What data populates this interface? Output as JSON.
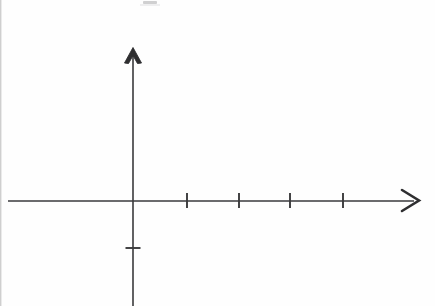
{
  "figure": {
    "background_color": "#fefefe",
    "stroke_color": "#3a3a3c",
    "width": 435,
    "height": 306
  },
  "chart_data": {
    "type": "scatter",
    "title": "",
    "subtitle": "",
    "xlabel": "",
    "ylabel": "",
    "grid": false,
    "legend": null,
    "annotations": [],
    "series": [
      {
        "name": "",
        "x": [],
        "y": []
      }
    ],
    "origin": {
      "x_px": 133,
      "y_px": 201
    },
    "x_axis": {
      "label": "",
      "start_px": 8,
      "end_px": 419,
      "axis_y_px": 201,
      "arrow": "right",
      "arrow_tip_px": {
        "x": 419,
        "y": 200
      },
      "tick_count": 4,
      "tick_positions_px": [
        187,
        239,
        290,
        343
      ],
      "tick_spacing_px": 52,
      "tick_length_px": 15,
      "tick_labels": [],
      "xlim": [
        -2.4,
        5.5
      ]
    },
    "y_axis": {
      "label": "",
      "start_px": 48,
      "end_px": 306,
      "axis_x_px": 133,
      "arrow": "up",
      "arrow_tip_px": {
        "x": 133,
        "y": 48
      },
      "tick_count": 1,
      "tick_positions_px": [
        248
      ],
      "tick_length_px": 15,
      "tick_labels": [],
      "ylim": [
        -2.0,
        2.9
      ]
    }
  },
  "artifacts": {
    "left_edge_streak": "scan-edge-streak",
    "top_smudge": "scan-smudge-mark"
  },
  "icons": {
    "x_arrow": "arrow-right-icon",
    "y_arrow": "arrow-up-icon"
  }
}
